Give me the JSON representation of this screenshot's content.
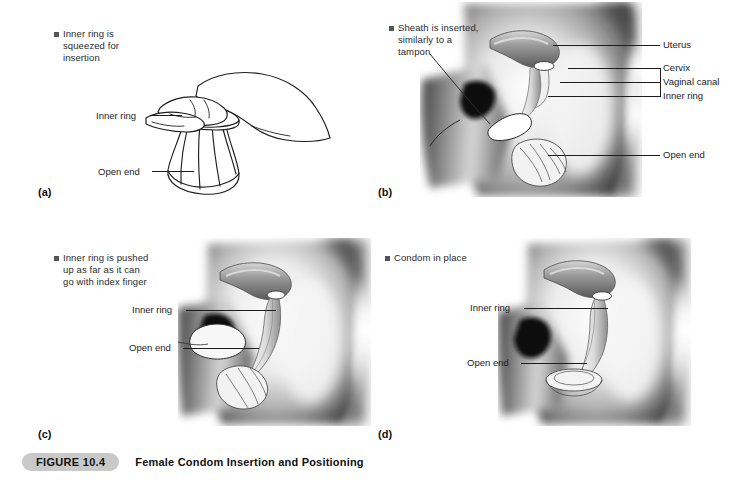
{
  "figure": {
    "number_label": "FIGURE 10.4",
    "title": "Female Condom Insertion and Positioning",
    "band_color": "#c9c9c9"
  },
  "panels": [
    {
      "letter": "(a)",
      "note": "Inner ring is\nsqueezed for\ninsertion",
      "labels": [
        {
          "text": "Inner ring"
        },
        {
          "text": "Open end"
        }
      ]
    },
    {
      "letter": "(b)",
      "note": "Sheath is inserted,\nsimilarly to a\ntampon",
      "labels": [
        {
          "text": "Uterus"
        },
        {
          "text": "Cervix"
        },
        {
          "text": "Vaginal canal"
        },
        {
          "text": "Inner ring"
        },
        {
          "text": "Open end"
        }
      ]
    },
    {
      "letter": "(c)",
      "note": "Inner ring is pushed\nup as far as it can\ngo with index finger",
      "labels": [
        {
          "text": "Inner ring"
        },
        {
          "text": "Open end"
        }
      ]
    },
    {
      "letter": "(d)",
      "note": "Condom in place",
      "labels": [
        {
          "text": "Inner ring"
        },
        {
          "text": "Open end"
        }
      ]
    }
  ],
  "colors": {
    "ink": "#1c1c1c",
    "note_text": "#2b2b2b",
    "bullet": "#555555",
    "page_background": "#ffffff"
  }
}
